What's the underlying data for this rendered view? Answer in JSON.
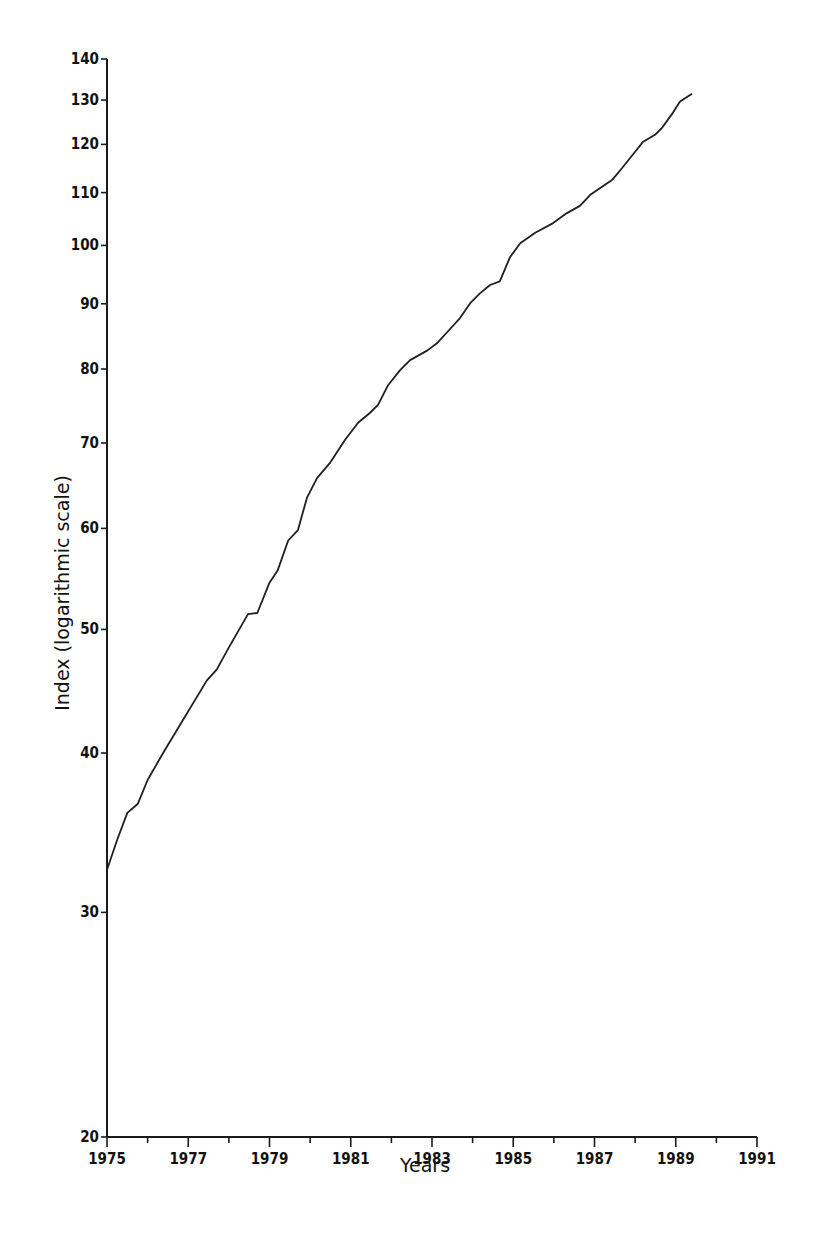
{
  "chart_data": {
    "type": "line",
    "title": "",
    "xlabel": "Years",
    "ylabel": "Index (logarithmic scale)",
    "yscale": "log",
    "xlim": [
      1975,
      1991
    ],
    "ylim": [
      20,
      140
    ],
    "grid": false,
    "legend": null,
    "x_ticks": [
      1975,
      1977,
      1979,
      1981,
      1983,
      1985,
      1987,
      1989,
      1991
    ],
    "x_minor_ticks": [
      1976,
      1978,
      1980,
      1982,
      1984,
      1986,
      1988,
      1990
    ],
    "y_ticks": [
      20,
      30,
      40,
      50,
      60,
      70,
      80,
      90,
      100,
      110,
      120,
      130,
      140
    ],
    "series": [
      {
        "name": "Index",
        "color": "#1f1f1f",
        "x": [
          1975.0,
          1975.25,
          1975.5,
          1975.76,
          1976.0,
          1976.38,
          1976.8,
          1977.46,
          1977.7,
          1978.0,
          1978.47,
          1978.7,
          1979.0,
          1979.2,
          1979.46,
          1979.7,
          1979.92,
          1980.17,
          1980.5,
          1980.86,
          1981.18,
          1981.47,
          1981.67,
          1981.92,
          1982.21,
          1982.46,
          1982.88,
          1983.12,
          1983.49,
          1983.69,
          1983.94,
          1984.18,
          1984.43,
          1984.67,
          1984.92,
          1985.17,
          1985.54,
          1985.98,
          1986.32,
          1986.64,
          1986.89,
          1987.14,
          1987.43,
          1987.68,
          1988.0,
          1988.19,
          1988.49,
          1988.66,
          1988.91,
          1989.1,
          1989.4
        ],
        "values": [
          32.4,
          34.2,
          35.9,
          36.5,
          38.1,
          40.0,
          42.1,
          45.6,
          46.5,
          48.4,
          51.4,
          51.5,
          54.4,
          55.6,
          58.7,
          59.8,
          63.4,
          65.7,
          67.6,
          70.4,
          72.6,
          73.9,
          75.0,
          77.7,
          79.8,
          81.3,
          82.7,
          83.8,
          86.3,
          87.7,
          90.1,
          91.7,
          93.1,
          93.7,
          97.9,
          100.4,
          102.3,
          104.1,
          106.0,
          107.4,
          109.5,
          110.9,
          112.5,
          115.0,
          118.4,
          120.5,
          122.1,
          123.6,
          126.8,
          129.6,
          131.5
        ]
      }
    ]
  },
  "layout": {
    "plot_left": 107,
    "plot_right": 757,
    "plot_top": 59,
    "plot_bottom": 1137
  }
}
